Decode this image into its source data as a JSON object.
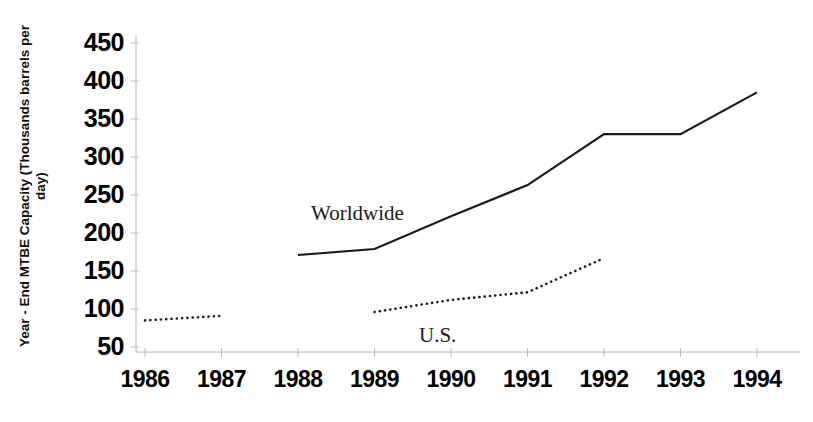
{
  "chart_data": {
    "type": "line",
    "title": "",
    "subtitle": "",
    "xlabel": "",
    "ylabel": "Year - End MTBE Capacity (Thousands barrels per day)",
    "categories": [
      "1986",
      "1987",
      "1988",
      "1989",
      "1990",
      "1991",
      "1992",
      "1993",
      "1994"
    ],
    "x": [
      1986,
      1987,
      1988,
      1989,
      1990,
      1991,
      1992,
      1993,
      1994
    ],
    "ytick_labels": [
      "450",
      "400",
      "350",
      "300",
      "250",
      "200",
      "150",
      "100",
      "50"
    ],
    "ytick_values": [
      450,
      400,
      350,
      300,
      250,
      200,
      150,
      100,
      50
    ],
    "ylim": [
      50,
      450
    ],
    "xlim": [
      1986,
      1994
    ],
    "grid": false,
    "legend_position": "inline-annotations",
    "series": [
      {
        "name": "Worldwide",
        "style": "solid",
        "color": "#1a1a1a",
        "x": [
          1988,
          1989,
          1990,
          1991,
          1992,
          1993,
          1994
        ],
        "values": [
          171,
          179,
          222,
          263,
          330,
          330,
          385
        ]
      },
      {
        "name": "U.S.",
        "style": "dotted",
        "color": "#1a1a1a",
        "x": [
          1986,
          1987,
          1989,
          1990,
          1991,
          1992
        ],
        "values": [
          85,
          91,
          96,
          112,
          122,
          167
        ],
        "segments": [
          {
            "x": [
              1986,
              1987
            ],
            "values": [
              85,
              91
            ]
          },
          {
            "x": [
              1989,
              1990,
              1991,
              1992
            ],
            "values": [
              96,
              112,
              122,
              167
            ]
          }
        ]
      }
    ],
    "annotations": [
      {
        "text": "Worldwide",
        "series": "Worldwide"
      },
      {
        "text": "U.S.",
        "series": "U.S."
      }
    ]
  },
  "axis": {
    "y_title": "Year - End MTBE Capacity (Thousands barrels per day)"
  }
}
